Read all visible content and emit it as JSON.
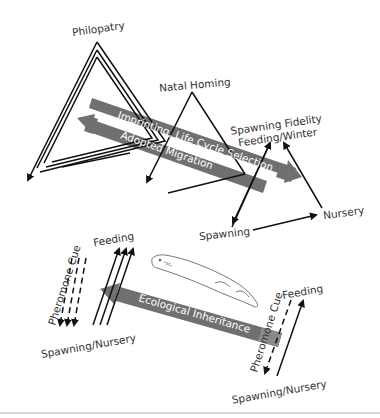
{
  "figure": {
    "top_section": {
      "labels": {
        "philopatry": "Philopatry",
        "natal_homing": "Natal Homing",
        "spawning_fidelity": "Spawning Fidelity",
        "feeding_winter": "Feeding/Winter",
        "spawning": "Spawning",
        "nursery": "Nursery"
      },
      "bands": {
        "imprinting": "Imprinting, Life Cycle Selection",
        "adopted": "Adopted Migration"
      }
    },
    "bottom_section": {
      "left": {
        "feeding": "Feeding",
        "pheromone": "Pheromone Cue",
        "spawning_nursery": "Spawning/Nursery"
      },
      "band": "Ecological Inheritance",
      "right": {
        "feeding": "Feeding",
        "pheromone": "Pheromone Cue",
        "spawning_nursery": "Spawning/Nursery"
      },
      "organism_icon": "lamprey-eel"
    },
    "colors": {
      "band": "#707070",
      "line": "#111111",
      "text": "#333333",
      "divider": "#cccccc"
    }
  }
}
